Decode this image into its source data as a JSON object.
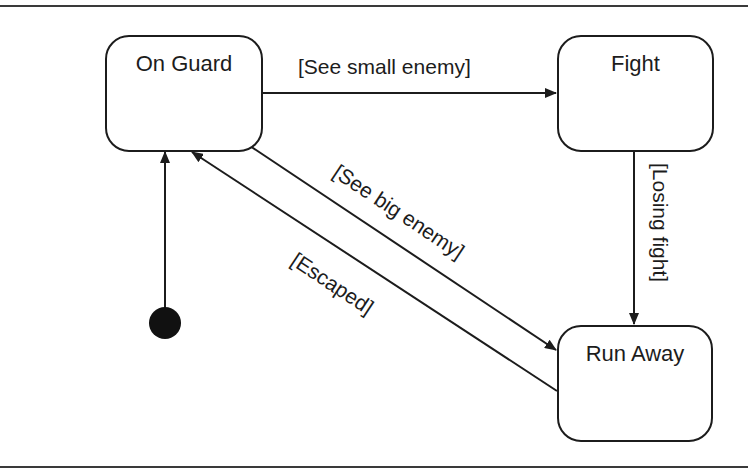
{
  "diagram": {
    "type": "uml-state-machine",
    "states": [
      {
        "id": "on_guard",
        "label": "On Guard"
      },
      {
        "id": "fight",
        "label": "Fight"
      },
      {
        "id": "run_away",
        "label": "Run Away"
      }
    ],
    "initial_state": "on_guard",
    "transitions": [
      {
        "from": "on_guard",
        "to": "fight",
        "label": "[See small enemy]"
      },
      {
        "from": "on_guard",
        "to": "run_away",
        "label": "[See big enemy]"
      },
      {
        "from": "fight",
        "to": "run_away",
        "label": "[Losing fight]"
      },
      {
        "from": "run_away",
        "to": "on_guard",
        "label": "[Escaped]"
      }
    ],
    "colors": {
      "stroke": "#1c1c1c",
      "background": "#ffffff",
      "rule": "#3a3a3a"
    }
  }
}
